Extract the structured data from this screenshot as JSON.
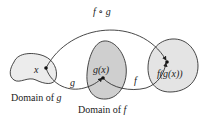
{
  "diagram": {
    "type": "function-composition",
    "colors": {
      "region_fill_light": "#ececec",
      "region_fill_mid": "#cfcfcf",
      "stroke": "#333333",
      "point": "#111111",
      "background": "#ffffff"
    },
    "regions": [
      {
        "id": "domain-g",
        "label": "Domain of g",
        "label_prefix": "Domain of ",
        "label_var": "g"
      },
      {
        "id": "domain-f",
        "label": "Domain of f",
        "label_prefix": "Domain of ",
        "label_var": "f"
      },
      {
        "id": "range",
        "label": ""
      }
    ],
    "points": [
      {
        "id": "x",
        "label": "x"
      },
      {
        "id": "gx",
        "label": "g(x)"
      },
      {
        "id": "fgx",
        "label": "f(g(x))"
      }
    ],
    "arrows": [
      {
        "id": "g",
        "label": "g",
        "from": "x",
        "to": "gx"
      },
      {
        "id": "f",
        "label": "f",
        "from": "gx",
        "to": "fgx"
      },
      {
        "id": "fog",
        "label": "f ∘ g",
        "from": "x",
        "to": "fgx"
      }
    ]
  }
}
